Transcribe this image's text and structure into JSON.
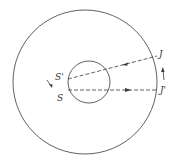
{
  "diagram": {
    "labels": {
      "s_prime": "S'",
      "s": "S",
      "j": "J",
      "j_prime": "J'"
    },
    "colors": {
      "stroke": "#3a3a3a",
      "background": "#ffffff"
    }
  }
}
